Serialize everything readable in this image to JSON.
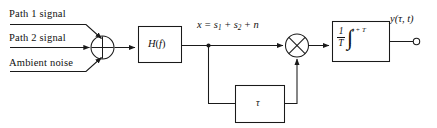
{
  "figure": {
    "type": "block-diagram",
    "stroke_color": "#1a1a1a",
    "background_color": "#ffffff"
  },
  "inputs": [
    {
      "id": "path1",
      "label": "Path 1 signal"
    },
    {
      "id": "path2",
      "label": "Path 2 signal"
    },
    {
      "id": "noise",
      "label": "Ambient noise"
    }
  ],
  "nodes": {
    "summer": {
      "name": "summing-junction",
      "symbol": "plus-in-circle"
    },
    "filter": {
      "name": "filter-block",
      "label": "H(f)",
      "letter": "H",
      "paren_open": "(",
      "variable": "f",
      "paren_close": ")"
    },
    "multiplier": {
      "name": "multiplier-junction",
      "symbol": "times-in-circle"
    },
    "delay": {
      "name": "delay-block",
      "label": "τ"
    },
    "integrator": {
      "name": "integrator-block",
      "fraction_numerator": "1",
      "fraction_denominator": "T",
      "integral_symbol": "∫",
      "limit_upper": "t + T",
      "limit_lower": "t"
    }
  },
  "signals": {
    "filter_output": {
      "x": "x",
      "equals": "=",
      "s1": "s",
      "s1_sub": "1",
      "plus1": "+",
      "s2": "s",
      "s2_sub": "2",
      "plus2": "+",
      "n": "n"
    },
    "output": {
      "label": "y(τ, t)",
      "terminal": "open-circle"
    }
  }
}
